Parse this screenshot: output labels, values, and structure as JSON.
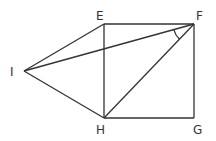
{
  "diagram": {
    "type": "geometry",
    "points": [
      {
        "id": "E",
        "label": "E",
        "x": 104,
        "y": 24,
        "lx": 96,
        "ly": 20
      },
      {
        "id": "F",
        "label": "F",
        "x": 194,
        "y": 24,
        "lx": 196,
        "ly": 20
      },
      {
        "id": "G",
        "label": "G",
        "x": 194,
        "y": 118,
        "lx": 193,
        "ly": 134
      },
      {
        "id": "H",
        "label": "H",
        "x": 104,
        "y": 118,
        "lx": 96,
        "ly": 134
      },
      {
        "id": "I",
        "label": "I",
        "x": 24,
        "y": 71,
        "lx": 10,
        "ly": 76
      }
    ],
    "segments": [
      [
        "E",
        "F"
      ],
      [
        "F",
        "G"
      ],
      [
        "G",
        "H"
      ],
      [
        "H",
        "E"
      ],
      [
        "I",
        "E"
      ],
      [
        "I",
        "H"
      ],
      [
        "I",
        "F"
      ],
      [
        "F",
        "H"
      ]
    ],
    "angle_marks": [
      {
        "vertex": "F",
        "between": [
          "I",
          "H"
        ]
      }
    ]
  }
}
